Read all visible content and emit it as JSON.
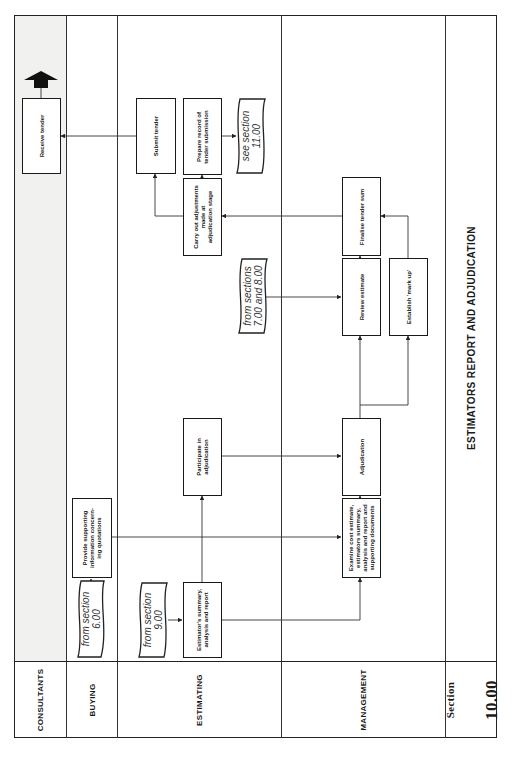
{
  "diagram": {
    "title": "ESTIMATORS REPORT AND ADJUDICATION",
    "section": {
      "label": "Section",
      "number": "10.00"
    },
    "orientation": "rotated 90° counter-clockwise (landscape page printed portrait)",
    "lanes": [
      {
        "id": "consultants",
        "label": "CONSULTANTS",
        "shaded": true
      },
      {
        "id": "buying",
        "label": "BUYING"
      },
      {
        "id": "estimating",
        "label": "ESTIMATING"
      },
      {
        "id": "management",
        "label": "MANAGEMENT"
      }
    ],
    "nodes": {
      "from_6": {
        "type": "document",
        "lane": "buying",
        "text": "from section\n6.00"
      },
      "provide_info": {
        "type": "process",
        "lane": "buying",
        "text": "Provide supporting\ninformation concern-\ning quotations"
      },
      "from_9": {
        "type": "document",
        "lane": "estimating",
        "text": "from section\n9.00"
      },
      "est_summary": {
        "type": "process",
        "lane": "estimating",
        "text": "Estimator's summary,\nanalysis and report"
      },
      "examine": {
        "type": "process",
        "lane": "management",
        "text": "Examine cost estimate,\nestimators summary,\nanalysis and report and\nsupporting documents"
      },
      "participate": {
        "type": "process",
        "lane": "estimating",
        "text": "Participate in\nadjudication"
      },
      "adjudication": {
        "type": "process",
        "lane": "management",
        "text": "Adjudication"
      },
      "from_7_8": {
        "type": "document",
        "lane": "estimating",
        "text": "from sections\n7.00 and 8.00"
      },
      "review": {
        "type": "process",
        "lane": "management",
        "text": "Review estimate"
      },
      "markup": {
        "type": "process",
        "lane": "management",
        "text": "Establish 'mark up'"
      },
      "finalise": {
        "type": "process",
        "lane": "management",
        "text": "Finalise tender sum"
      },
      "adjust": {
        "type": "process",
        "lane": "estimating",
        "text": "Carry out adjustments\nmade at\nadjudication stage"
      },
      "submit": {
        "type": "process",
        "lane": "estimating",
        "text": "Submit tender"
      },
      "record": {
        "type": "process",
        "lane": "estimating",
        "text": "Prepare record of\ntender submission"
      },
      "see_11": {
        "type": "document",
        "lane": "estimating",
        "text": "see section\n11.00"
      },
      "receive": {
        "type": "process",
        "lane": "consultants",
        "text": "Receive tender"
      }
    },
    "edges": [
      [
        "from_6",
        "provide_info"
      ],
      [
        "provide_info",
        "examine"
      ],
      [
        "from_9",
        "est_summary"
      ],
      [
        "est_summary",
        "examine"
      ],
      [
        "est_summary",
        "participate"
      ],
      [
        "examine",
        "adjudication"
      ],
      [
        "participate",
        "adjudication"
      ],
      [
        "adjudication",
        "review"
      ],
      [
        "adjudication",
        "markup"
      ],
      [
        "from_7_8",
        "review"
      ],
      [
        "review",
        "finalise"
      ],
      [
        "markup",
        "finalise"
      ],
      [
        "finalise",
        "adjust"
      ],
      [
        "adjust",
        "submit"
      ],
      [
        "adjust",
        "record"
      ],
      [
        "record",
        "see_11"
      ],
      [
        "submit",
        "receive"
      ],
      [
        "receive",
        "exit"
      ]
    ]
  }
}
